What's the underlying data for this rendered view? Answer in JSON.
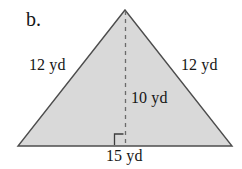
{
  "figure": {
    "part_label": "b.",
    "shape": "isosceles-triangle",
    "fill_color": "#d9d9d9",
    "stroke_color": "#4d4d4d",
    "background_color": "#ffffff",
    "labels": {
      "left_side": "12 yd",
      "right_side": "12 yd",
      "height": "10 yd",
      "base": "15 yd"
    },
    "measurements": {
      "left_side_value": 12,
      "right_side_value": 12,
      "height_value": 10,
      "base_value": 15,
      "units": "yd"
    },
    "markers": {
      "right_angle": "right-angle-square",
      "height_line_style": "dashed"
    },
    "geometry": {
      "apex": [
        125,
        10
      ],
      "bottom_left": [
        18,
        146
      ],
      "bottom_right": [
        232,
        146
      ],
      "height_foot": [
        125,
        146
      ]
    }
  }
}
